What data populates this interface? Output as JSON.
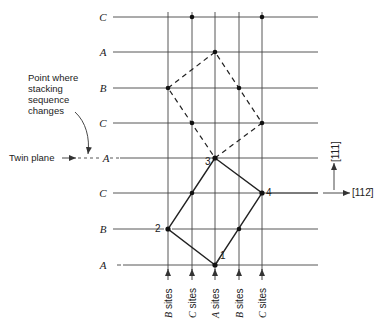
{
  "figure": {
    "rows": [
      {
        "label": "C",
        "y": 17
      },
      {
        "label": "A",
        "y": 52
      },
      {
        "label": "B",
        "y": 88
      },
      {
        "label": "C",
        "y": 123
      },
      {
        "label": "A",
        "y": 158,
        "twin_plane": true
      },
      {
        "label": "C",
        "y": 193
      },
      {
        "label": "B",
        "y": 229
      },
      {
        "label": "A",
        "y": 265
      }
    ],
    "columns": [
      {
        "label_italic": "B",
        "label_rest": " sites",
        "x": 168
      },
      {
        "label_italic": "C",
        "label_rest": " sites",
        "x": 192
      },
      {
        "label_italic": "A",
        "label_rest": " sites",
        "x": 215
      },
      {
        "label_italic": "B",
        "label_rest": " sites",
        "x": 239
      },
      {
        "label_italic": "C",
        "label_rest": " sites",
        "x": 262
      }
    ],
    "annotations": {
      "stacking_change": [
        "Point where",
        "stacking",
        "sequence",
        "changes"
      ],
      "twin_plane": "Twin plane"
    },
    "points": [
      {
        "label": "1",
        "x": 215,
        "y": 265
      },
      {
        "label": "2",
        "x": 168,
        "y": 229
      },
      {
        "label": "3",
        "x": 215,
        "y": 158
      },
      {
        "label": "4",
        "x": 262,
        "y": 193
      }
    ],
    "directions": {
      "vertical": "[111]",
      "horizontal": "[112̄]"
    },
    "colors": {
      "line": "#333333",
      "text": "#222222"
    }
  }
}
